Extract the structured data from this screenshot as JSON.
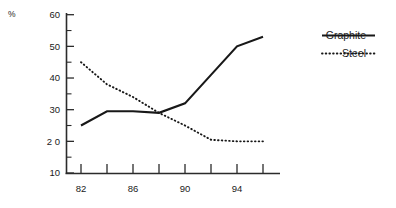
{
  "chart_data": {
    "type": "line",
    "title": "",
    "xlabel": "",
    "ylabel": "%",
    "ylim": [
      10,
      60
    ],
    "xlim": [
      82,
      96
    ],
    "grid": false,
    "legend_position": "right",
    "y_ticks": [
      "60",
      "50",
      "40",
      "30",
      "2 0",
      "10"
    ],
    "y_tick_values": [
      60,
      50,
      40,
      30,
      20,
      10
    ],
    "y_minor_tick_values": [
      55,
      45,
      35,
      25,
      15
    ],
    "x": [
      82,
      84,
      86,
      88,
      90,
      92,
      94,
      96
    ],
    "x_tick_labels": [
      "82",
      "",
      "86",
      "",
      "90",
      "",
      "94",
      ""
    ],
    "categories": [
      "82",
      "84",
      "86",
      "88",
      "90",
      "92",
      "94",
      "96"
    ],
    "series": [
      {
        "name": "Graphite",
        "style": "solid",
        "color": "#181818",
        "values": [
          25,
          29.5,
          29.5,
          29,
          32,
          41,
          50,
          53
        ]
      },
      {
        "name": "Steel",
        "style": "dotted",
        "color": "#181818",
        "values": [
          45,
          38,
          34,
          29,
          25,
          20.5,
          20,
          20
        ]
      }
    ]
  },
  "legend": {
    "entries": [
      {
        "label": "Graphite",
        "style": "solid"
      },
      {
        "label": "Steel",
        "style": "dotted"
      }
    ]
  }
}
